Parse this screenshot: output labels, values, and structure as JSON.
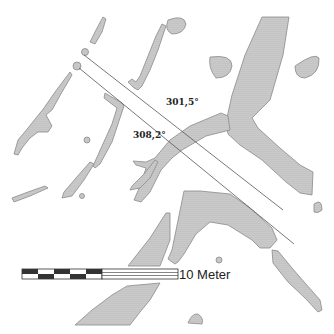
{
  "figure": {
    "type": "archaeological site plan",
    "sightlines": [
      {
        "label": "301,5°",
        "from": [
          77,
          55
        ],
        "to": [
          279,
          209
        ]
      },
      {
        "label": "308,2°",
        "from": [
          76,
          66
        ],
        "to": [
          295,
          244
        ]
      }
    ],
    "scale_bar": {
      "label": "10 Meter",
      "segments": 5,
      "colors": {
        "dark": "#333333",
        "light": "#ffffff"
      }
    },
    "colors": {
      "feature_fill": "#c8c8c8",
      "feature_stroke": "#8a8a8a",
      "line": "#555555",
      "background": "#ffffff"
    }
  }
}
